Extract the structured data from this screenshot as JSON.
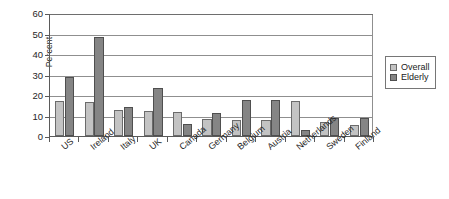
{
  "chart_data": {
    "type": "bar",
    "title": "",
    "xlabel": "",
    "ylabel": "Percent",
    "ylim": [
      0,
      60
    ],
    "yticks": [
      0,
      10,
      20,
      30,
      40,
      50,
      60
    ],
    "grid": true,
    "legend_position": "right",
    "categories": [
      "US",
      "Ireland",
      "Italy",
      "UK",
      "Canada",
      "Germany",
      "Belgium",
      "Austria",
      "Netherlands",
      "Sweden",
      "Finland"
    ],
    "series": [
      {
        "name": "Overall",
        "color": "#c3c3c3",
        "values": [
          17.3,
          16.8,
          12.7,
          12.3,
          11.6,
          8.2,
          7.9,
          7.9,
          17.0,
          6.6,
          5.6
        ]
      },
      {
        "name": "Elderly",
        "color": "#858585",
        "values": [
          28.8,
          48.5,
          14.3,
          23.5,
          5.9,
          11.1,
          17.6,
          17.6,
          2.8,
          8.8,
          8.8
        ]
      }
    ]
  },
  "axis": {
    "y_title": "Percent",
    "y_tick_labels": [
      "60",
      "50",
      "40",
      "30",
      "20",
      "10",
      "0"
    ]
  },
  "legend": {
    "items": [
      {
        "label": "Overall",
        "swatch": "overall-swatch"
      },
      {
        "label": "Elderly",
        "swatch": "elderly-swatch"
      }
    ]
  }
}
